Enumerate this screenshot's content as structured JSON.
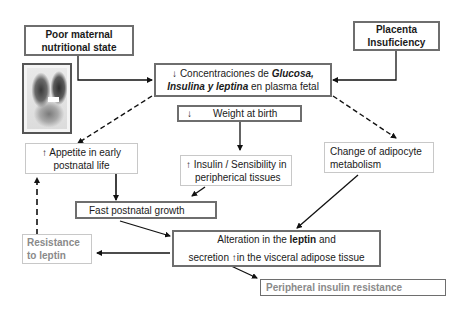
{
  "diagram": {
    "nodes": {
      "poor_maternal": {
        "lines": [
          "Poor maternal",
          "nutritional state"
        ]
      },
      "placenta": {
        "lines": [
          "Placenta",
          "Insuficiency"
        ]
      },
      "concentraciones": {
        "line1_arrow": "↓",
        "line1_prefix": " Concentraciones de ",
        "line1_bold": "Glucosa,",
        "line2_bold": "Insulina y leptina",
        "line2_suffix": " en plasma fetal"
      },
      "weight": {
        "arrow": "↓",
        "label": "Weight at birth"
      },
      "appetite": {
        "arrow": "↑",
        "lines": [
          "Appetite in early",
          "postnatal life"
        ]
      },
      "insulin_sens": {
        "arrow": "↑",
        "lines": [
          "Insulin / Sensibility in",
          "peripherical tissues"
        ]
      },
      "adipocyte": {
        "lines": [
          "Change of adipocyte",
          "metabolism"
        ]
      },
      "fast_growth": {
        "label": "Fast postnatal growth"
      },
      "resistance_leptin": {
        "lines": [
          "Resistance",
          "to leptin"
        ]
      },
      "alteration": {
        "line1_prefix": "Alteration in the ",
        "line1_bold": "leptin",
        "line1_suffix": " and",
        "line2_prefix": "secretion ",
        "line2_arrow": "↑",
        "line2_suffix": "in the visceral adipose tissue"
      },
      "peripheral_ir": {
        "label": "Peripheral insulin resistance"
      }
    },
    "image": {
      "icon": "fetus-ultrasound-image"
    },
    "colors": {
      "border_dark": "#6e6e6e",
      "border_light": "#c8c8c8",
      "text_gray": "#8a8a8a",
      "arrow": "#111111"
    }
  }
}
